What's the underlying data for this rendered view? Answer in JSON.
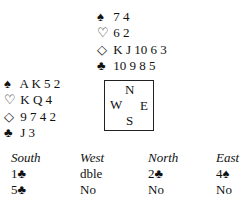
{
  "north": {
    "position": "North",
    "hand": [
      {
        "suit": "spades",
        "symbol": "♠",
        "cards": "7 4"
      },
      {
        "suit": "hearts",
        "symbol": "♡",
        "cards": "6 2"
      },
      {
        "suit": "diamonds",
        "symbol": "◇",
        "cards": "K J 10 6 3"
      },
      {
        "suit": "clubs",
        "symbol": "♣",
        "cards": "10 9 8 5"
      }
    ]
  },
  "west": {
    "position": "West",
    "hand": [
      {
        "suit": "spades",
        "symbol": "♠",
        "cards": "A K 5 2"
      },
      {
        "suit": "hearts",
        "symbol": "♡",
        "cards": "K Q 4"
      },
      {
        "suit": "diamonds",
        "symbol": "◇",
        "cards": "9 7 4 2"
      },
      {
        "suit": "clubs",
        "symbol": "♣",
        "cards": "J 3"
      }
    ]
  },
  "compass": {
    "n": "N",
    "w": "W",
    "e": "E",
    "s": "S"
  },
  "auction": {
    "headers": [
      "South",
      "West",
      "North",
      "East"
    ],
    "rows": [
      [
        "1♣",
        "dble",
        "2♣",
        "4♠"
      ],
      [
        "5♣",
        "No",
        "No",
        "No"
      ]
    ]
  }
}
